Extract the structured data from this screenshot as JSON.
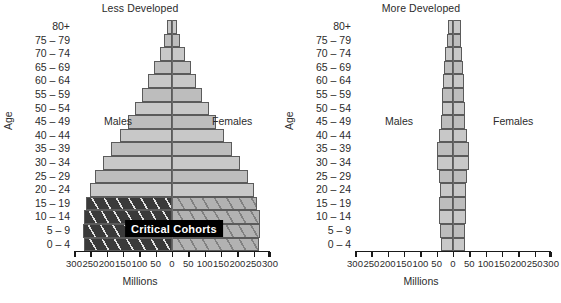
{
  "figure": {
    "y_axis_label": "Age",
    "x_axis_label": "Millions",
    "male_label": "Males",
    "female_label": "Females",
    "annotation": "Critical Cohorts",
    "age_groups": [
      "80+",
      "75 – 79",
      "70 – 74",
      "65 – 69",
      "60 – 64",
      "55 – 59",
      "50 – 54",
      "45 – 49",
      "40 – 44",
      "35 – 39",
      "30 – 34",
      "25 – 29",
      "20 – 24",
      "15 – 19",
      "10 – 14",
      "5 – 9",
      "0 – 4"
    ],
    "x_ticks": [
      "300",
      "250",
      "200",
      "150",
      "100",
      "50",
      "0",
      "50",
      "100",
      "150",
      "200",
      "250",
      "300"
    ],
    "colors": {
      "bar_light": "#c8c8c8",
      "bar_mid": "#b4b4b4",
      "bar_critical_male": "#3a3a3a",
      "bar_critical_female": "#b0b0b0",
      "outline": "#5b5b5b",
      "annotation_bg": "#000000",
      "annotation_fg": "#ffffff"
    }
  },
  "chart_data": [
    {
      "type": "bar",
      "title": "Less Developed",
      "subtype": "population-pyramid",
      "xlabel": "Millions",
      "ylabel": "Age",
      "xlim": [
        -300,
        300
      ],
      "grid": false,
      "legend": "none",
      "categories": [
        "80+",
        "75 – 79",
        "70 – 74",
        "65 – 69",
        "60 – 64",
        "55 – 59",
        "50 – 54",
        "45 – 49",
        "40 – 44",
        "35 – 39",
        "30 – 34",
        "25 – 29",
        "20 – 24",
        "15 – 19",
        "10 – 14",
        "5 – 9",
        "0 – 4"
      ],
      "series": [
        {
          "name": "Males",
          "values": [
            14,
            24,
            38,
            55,
            73,
            92,
            113,
            136,
            160,
            186,
            211,
            235,
            252,
            262,
            270,
            272,
            268
          ]
        },
        {
          "name": "Females",
          "values": [
            16,
            26,
            40,
            57,
            74,
            93,
            113,
            136,
            159,
            184,
            209,
            233,
            250,
            260,
            268,
            270,
            266
          ]
        }
      ],
      "annotations": [
        {
          "text": "Critical Cohorts",
          "at_categories": [
            "15 – 19",
            "10 – 14",
            "5 – 9",
            "0 – 4"
          ]
        }
      ]
    },
    {
      "type": "bar",
      "title": "More Developed",
      "subtype": "population-pyramid",
      "xlabel": "Millions",
      "ylabel": "Age",
      "xlim": [
        -300,
        300
      ],
      "grid": false,
      "legend": "none",
      "categories": [
        "80+",
        "75 – 79",
        "70 – 74",
        "65 – 69",
        "60 – 64",
        "55 – 59",
        "50 – 54",
        "45 – 49",
        "40 – 44",
        "35 – 39",
        "30 – 34",
        "25 – 29",
        "20 – 24",
        "15 – 19",
        "10 – 14",
        "5 – 9",
        "0 – 4"
      ],
      "series": [
        {
          "name": "Males",
          "values": [
            14,
            17,
            24,
            28,
            31,
            33,
            35,
            37,
            42,
            48,
            48,
            43,
            41,
            42,
            43,
            40,
            38
          ]
        },
        {
          "name": "Females",
          "values": [
            24,
            25,
            29,
            32,
            33,
            35,
            36,
            38,
            43,
            49,
            49,
            43,
            41,
            41,
            41,
            38,
            36
          ]
        }
      ]
    }
  ]
}
